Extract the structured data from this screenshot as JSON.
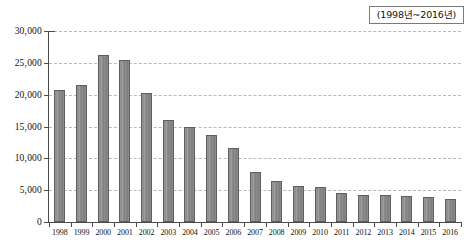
{
  "legend": {
    "period_label": "(1998년~2016년)"
  },
  "axis": {
    "y_ticks": [
      "0",
      "5,000",
      "10,000",
      "15,000",
      "20,000",
      "25,000",
      "30,000"
    ],
    "y_tick_values": [
      0,
      5000,
      10000,
      15000,
      20000,
      25000,
      30000
    ]
  },
  "chart_data": {
    "type": "bar",
    "title": "",
    "subtitle": "",
    "xlabel": "",
    "ylabel": "",
    "ylim": [
      0,
      30000
    ],
    "grid": true,
    "legend_position": "top-right",
    "annotations": [
      "(1998년~2016년)"
    ],
    "categories": [
      "1998",
      "1999",
      "2000",
      "2001",
      "2002",
      "2003",
      "2004",
      "2005",
      "2006",
      "2007",
      "2008",
      "2009",
      "2010",
      "2011",
      "2012",
      "2013",
      "2014",
      "2015",
      "2016"
    ],
    "values": [
      20800,
      21500,
      26200,
      25400,
      20200,
      16100,
      15000,
      13700,
      11700,
      7900,
      6400,
      5700,
      5500,
      4500,
      4200,
      4200,
      4100,
      4000,
      3600
    ],
    "tick_labels": {
      "y": [
        "0",
        "5,000",
        "10,000",
        "15,000",
        "20,000",
        "25,000",
        "30,000"
      ],
      "x": [
        "1998",
        "1999",
        "2000",
        "2001",
        "2002",
        "2003",
        "2004",
        "2005",
        "2006",
        "2007",
        "2008",
        "2009",
        "2010",
        "2011",
        "2012",
        "2013",
        "2014",
        "2015",
        "2016"
      ]
    }
  }
}
